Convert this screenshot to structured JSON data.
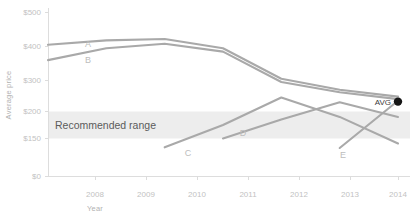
{
  "chart_data": {
    "type": "line",
    "title": "",
    "xlabel": "Year",
    "ylabel": "Average price",
    "x": [
      2008,
      2009,
      2010,
      2011,
      2012,
      2013,
      2014
    ],
    "xtick_labels": [
      "2008",
      "2009",
      "2010",
      "2011",
      "2012",
      "2013",
      "2014"
    ],
    "ytick_labels": [
      "$0",
      "$150",
      "$200",
      "$300",
      "$400",
      "$500"
    ],
    "ytick_values": [
      0,
      150,
      200,
      300,
      400,
      500
    ],
    "ylim": [
      0,
      500
    ],
    "xlim": [
      2007.5,
      2014.2
    ],
    "grid": false,
    "legend": "inline-series-labels",
    "series": [
      {
        "name": "A",
        "label": "A",
        "x": [
          2008,
          2009,
          2010,
          2011,
          2012,
          2013,
          2014
        ],
        "values": [
          405,
          418,
          422,
          395,
          305,
          270,
          248
        ]
      },
      {
        "name": "B",
        "label": "B",
        "x": [
          2008,
          2009,
          2010,
          2011,
          2012,
          2013,
          2014
        ],
        "values": [
          360,
          395,
          408,
          385,
          295,
          262,
          240
        ]
      },
      {
        "name": "C",
        "label": "C",
        "x": [
          2010,
          2011,
          2012,
          2013,
          2014
        ],
        "values": [
          115,
          175,
          245,
          190,
          130
        ]
      },
      {
        "name": "D",
        "label": "D",
        "x": [
          2011,
          2012,
          2013,
          2014
        ],
        "values": [
          150,
          185,
          230,
          190
        ]
      },
      {
        "name": "E",
        "label": "E",
        "x": [
          2013,
          2014
        ],
        "values": [
          112,
          235
        ]
      }
    ],
    "bands": [
      {
        "name": "recommended-range",
        "label": "Recommended range",
        "y_low": 150,
        "y_high": 200,
        "color": "#ededed"
      }
    ],
    "annotations": [
      {
        "name": "avg-marker",
        "label": "AVG",
        "x": 2014,
        "y": 232,
        "marker": "filled-circle",
        "color": "#161616"
      }
    ],
    "colors": {
      "line": "#a9a9a9",
      "band": "#ededed",
      "tick_text": "#c2c2c2",
      "axis_title": "#b2b2b2",
      "band_text": "#5b5b5b",
      "marker": "#161616",
      "background": "#ffffff"
    }
  }
}
